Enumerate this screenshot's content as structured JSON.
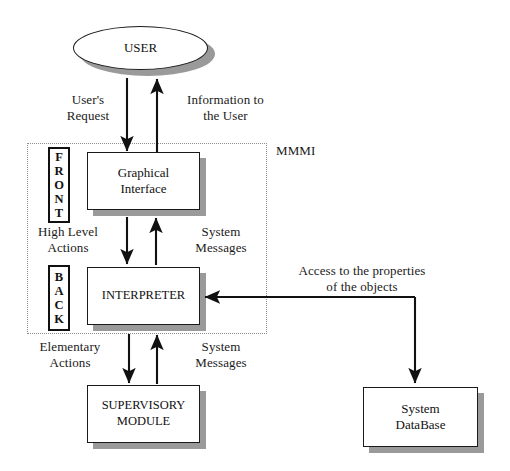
{
  "diagram": {
    "background_color": "#ffffff",
    "line_color": "#1a1a1a",
    "shadow_color": "#9a9a9a",
    "dotted_border_color": "#8d8d8d"
  },
  "region": {
    "label": "MMMI"
  },
  "nodes": {
    "user": "USER",
    "graphical_interface": "Graphical\nInterface",
    "interpreter": "INTERPRETER",
    "supervisory_module": "SUPERVISORY\nMODULE",
    "system_database": "System\nDataBase"
  },
  "tags": {
    "front": [
      "F",
      "R",
      "O",
      "N",
      "T"
    ],
    "back": [
      "B",
      "A",
      "C",
      "K"
    ]
  },
  "edge_labels": {
    "users_request": "User's\nRequest",
    "information_to_the_user": "Information to\nthe User",
    "high_level_actions": "High Level\nActions",
    "system_messages_upper": "System\nMessages",
    "elementary_actions": "Elementary\nActions",
    "system_messages_lower": "System\nMessages",
    "access_to_properties": "Access to the properties\nof the objects"
  }
}
